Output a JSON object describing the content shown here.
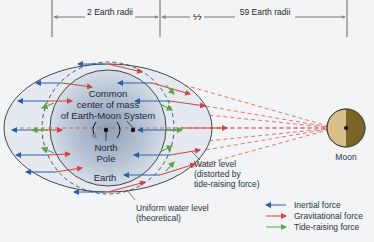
{
  "diagram": {
    "dimensions": {
      "left_label": "2 Earth radii",
      "break_symbol": "ϟϟ",
      "right_label": "59 Earth radii"
    },
    "earth_labels": {
      "center_line1": "Common",
      "center_line2": "center of mass",
      "center_line3": "of Earth-Moon System",
      "pole_line1": "North",
      "pole_line2": "Pole",
      "earth": "Earth"
    },
    "annotations": {
      "water_level_line1": "Water level",
      "water_level_line2": "(distorted by",
      "water_level_line3": "tide-raising force)",
      "uniform_line1": "Uniform water level",
      "uniform_line2": "(theoretical)"
    },
    "moon_label": "Moon",
    "legend": [
      {
        "label": "Inertial force",
        "color": "#2f5fa8"
      },
      {
        "label": "Gravitational force",
        "color": "#d8403a"
      },
      {
        "label": "Tide-raising force",
        "color": "#5aa547"
      }
    ],
    "colors": {
      "inertial": "#2f5fa8",
      "gravitational": "#d8403a",
      "tide_raising": "#5aa547",
      "moon_light": "#d6c08a",
      "moon_dark": "#7a6428"
    }
  }
}
